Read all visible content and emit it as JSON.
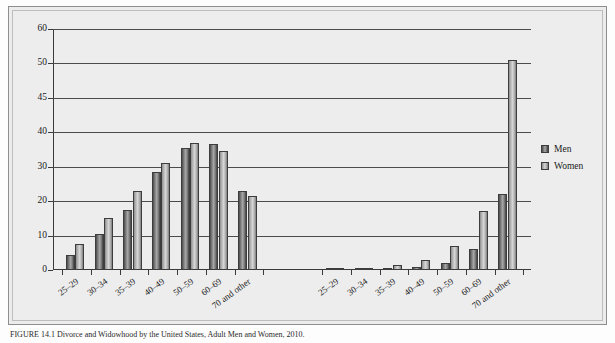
{
  "chart_data": {
    "type": "bar",
    "title": "",
    "xlabel": "",
    "ylabel": "",
    "ylim": [
      0,
      60
    ],
    "grid": true,
    "legend_position": "right",
    "y_ticks": [
      0,
      10,
      20,
      30,
      40,
      45,
      50,
      60
    ],
    "categories": [
      "25–29",
      "30–34",
      "35–39",
      "40–49",
      "50–59",
      "60–69",
      "70 and other"
    ],
    "panels": [
      {
        "name": "Percent divorced",
        "series": [
          {
            "name": "Men",
            "values": [
              4.5,
              10.5,
              17.5,
              28.5,
              35.5,
              36.5,
              23.0
            ]
          },
          {
            "name": "Women",
            "values": [
              7.5,
              15.0,
              23.0,
              31.0,
              37.0,
              34.5,
              21.5
            ]
          }
        ]
      },
      {
        "name": "Percent widowed",
        "series": [
          {
            "name": "Men",
            "values": [
              0.2,
              0.4,
              0.5,
              1.0,
              2.0,
              6.0,
              22.0
            ]
          },
          {
            "name": "Women",
            "values": [
              0.3,
              0.7,
              1.5,
              2.8,
              7.0,
              17.0,
              51.0
            ]
          }
        ]
      }
    ],
    "legend": [
      {
        "label": "Men",
        "color": "#6f6f6f"
      },
      {
        "label": "Women",
        "color": "#c2c2c2"
      }
    ]
  },
  "caption": {
    "text": "FIGURE 14.1  Divorce and Widowhood by the United States, Adult Men and Women, 2010."
  }
}
